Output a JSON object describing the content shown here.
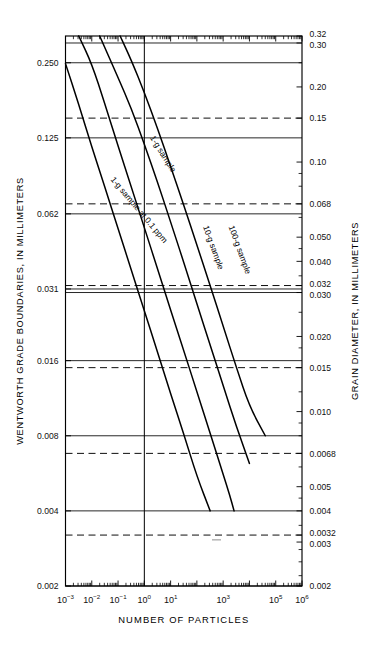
{
  "figure": {
    "background": "#ffffff",
    "ink": "#000000"
  },
  "axes": {
    "left": {
      "title": "WENTWORTH GRADE BOUNDARIES, IN MILLIMETERS",
      "ticks": [
        "0.250",
        "0.125",
        "0.062",
        "0.031",
        "0.016",
        "0.008",
        "0.004",
        "0.002"
      ],
      "values": [
        0.25,
        0.125,
        0.062,
        0.031,
        0.016,
        0.008,
        0.004,
        0.002
      ]
    },
    "right": {
      "title": "GRAIN DIAMETER, IN MILLIMETERS",
      "ticks": [
        "0.32",
        "0.30",
        "0.20",
        "0.15",
        "0.10",
        "0.068",
        "0.050",
        "0.040",
        "0.032",
        "0.030",
        "0.020",
        "0.015",
        "0.010",
        "0.0068",
        "0.005",
        "0.004",
        "0.0032",
        "0.003",
        "0.002"
      ],
      "values": [
        0.32,
        0.3,
        0.2,
        0.15,
        0.1,
        0.068,
        0.05,
        0.04,
        0.032,
        0.03,
        0.02,
        0.015,
        0.01,
        0.0068,
        0.005,
        0.004,
        0.0032,
        0.003,
        0.002
      ],
      "dashed_values": [
        0.15,
        0.068,
        0.032,
        0.015,
        0.0068,
        0.0032
      ]
    },
    "bottom": {
      "title": "NUMBER OF PARTICLES",
      "ticks": [
        {
          "mantissa": "10",
          "exponent": "−3",
          "value": 0.001
        },
        {
          "mantissa": "10",
          "exponent": "−2",
          "value": 0.01
        },
        {
          "mantissa": "10",
          "exponent": "−1",
          "value": 0.1
        },
        {
          "mantissa": "10",
          "exponent": "0",
          "value": 1
        },
        {
          "mantissa": "10",
          "exponent": "1",
          "value": 10
        },
        {
          "mantissa": "10",
          "exponent": "3",
          "value": 1000
        },
        {
          "mantissa": "10",
          "exponent": "5",
          "value": 100000
        },
        {
          "mantissa": "10",
          "exponent": "6",
          "value": 1000000
        }
      ]
    }
  },
  "chart_data": {
    "type": "line",
    "title": "",
    "xlabel": "NUMBER OF PARTICLES",
    "ylabel": "WENTWORTH GRADE BOUNDARIES, IN MILLIMETERS",
    "y2label": "GRAIN DIAMETER, IN MILLIMETERS",
    "xscale": "log",
    "yscale": "log",
    "xlim": [
      0.001,
      1000000
    ],
    "ylim": [
      0.002,
      0.32
    ],
    "grid": true,
    "legend": "inline-curve-labels",
    "annotations": [
      {
        "text": "1-g sample at 0.1 ppm",
        "x": 0.05,
        "y": 0.085
      },
      {
        "text": "1-g sample",
        "x": 1.6,
        "y": 0.125
      },
      {
        "text": "10-g sample",
        "x": 170,
        "y": 0.055
      },
      {
        "text": "100-g sample",
        "x": 1600,
        "y": 0.055
      }
    ],
    "reference_line": {
      "label": "10^0",
      "x": 1
    },
    "series": [
      {
        "name": "1-g sample at 0.1 ppm",
        "points": [
          {
            "x": 0.001,
            "y": 0.248
          },
          {
            "x": 0.0032,
            "y": 0.17
          },
          {
            "x": 0.01,
            "y": 0.115
          },
          {
            "x": 0.032,
            "y": 0.079
          },
          {
            "x": 0.1,
            "y": 0.054
          },
          {
            "x": 0.32,
            "y": 0.037
          },
          {
            "x": 1.0,
            "y": 0.0253
          },
          {
            "x": 3.2,
            "y": 0.0173
          },
          {
            "x": 10,
            "y": 0.0118
          },
          {
            "x": 32,
            "y": 0.0081
          },
          {
            "x": 100,
            "y": 0.0055
          },
          {
            "x": 320,
            "y": 0.004
          }
        ]
      },
      {
        "name": "1-g sample",
        "points": [
          {
            "x": 0.0032,
            "y": 0.32
          },
          {
            "x": 0.01,
            "y": 0.248
          },
          {
            "x": 0.032,
            "y": 0.17
          },
          {
            "x": 0.1,
            "y": 0.116
          },
          {
            "x": 0.32,
            "y": 0.0795
          },
          {
            "x": 1.0,
            "y": 0.0545
          },
          {
            "x": 3.2,
            "y": 0.0373
          },
          {
            "x": 10,
            "y": 0.0255
          },
          {
            "x": 32,
            "y": 0.0175
          },
          {
            "x": 100,
            "y": 0.012
          },
          {
            "x": 320,
            "y": 0.0082
          },
          {
            "x": 1000,
            "y": 0.0056
          },
          {
            "x": 1800,
            "y": 0.0046
          },
          {
            "x": 2600,
            "y": 0.004
          }
        ]
      },
      {
        "name": "10-g sample",
        "points": [
          {
            "x": 0.02,
            "y": 0.32
          },
          {
            "x": 0.1,
            "y": 0.218
          },
          {
            "x": 0.32,
            "y": 0.164
          },
          {
            "x": 1.0,
            "y": 0.118
          },
          {
            "x": 3.2,
            "y": 0.083
          },
          {
            "x": 10,
            "y": 0.0575
          },
          {
            "x": 32,
            "y": 0.0395
          },
          {
            "x": 100,
            "y": 0.027
          },
          {
            "x": 320,
            "y": 0.0185
          },
          {
            "x": 1000,
            "y": 0.0127
          },
          {
            "x": 3200,
            "y": 0.0087
          },
          {
            "x": 10000,
            "y": 0.0062
          }
        ]
      },
      {
        "name": "100-g sample",
        "points": [
          {
            "x": 0.12,
            "y": 0.32
          },
          {
            "x": 0.32,
            "y": 0.256
          },
          {
            "x": 1.0,
            "y": 0.19
          },
          {
            "x": 3.2,
            "y": 0.136
          },
          {
            "x": 10,
            "y": 0.096
          },
          {
            "x": 32,
            "y": 0.067
          },
          {
            "x": 100,
            "y": 0.0465
          },
          {
            "x": 320,
            "y": 0.032
          },
          {
            "x": 1000,
            "y": 0.022
          },
          {
            "x": 3200,
            "y": 0.015
          },
          {
            "x": 10000,
            "y": 0.0105
          },
          {
            "x": 40000,
            "y": 0.008
          }
        ]
      }
    ]
  }
}
